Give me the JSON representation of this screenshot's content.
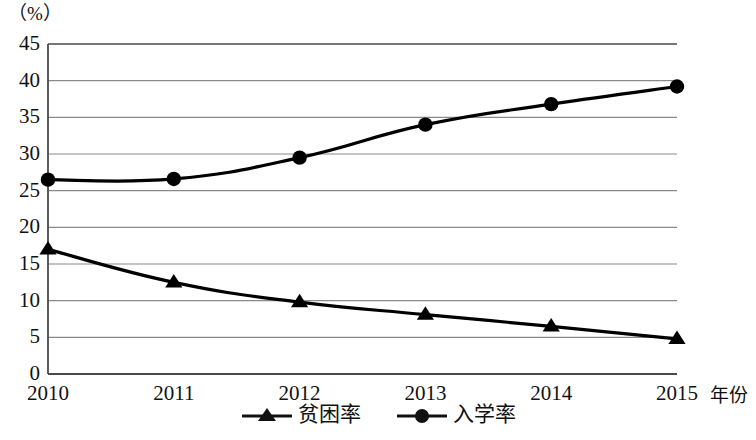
{
  "chart_data": {
    "type": "line",
    "title": "",
    "subtitle": "",
    "xlabel": "年份",
    "ylabel": "（%）",
    "unit_label": "（%）",
    "categories": [
      "2010",
      "2011",
      "2012",
      "2013",
      "2014",
      "2015"
    ],
    "x": [
      2010,
      2011,
      2012,
      2013,
      2014,
      2015
    ],
    "xlim": [
      2010,
      2015
    ],
    "ylim": [
      0,
      45
    ],
    "ytick_labels": [
      "45",
      "40",
      "35",
      "30",
      "25",
      "20",
      "15",
      "10",
      "5",
      "0"
    ],
    "yticks": [
      45,
      40,
      35,
      30,
      25,
      20,
      15,
      10,
      5,
      0
    ],
    "ytick_step": 5,
    "grid": true,
    "grid_axis": "y",
    "legend_position": "bottom",
    "series": [
      {
        "name": "贫困率",
        "marker": "triangle",
        "color": "#000000",
        "values": [
          17.0,
          12.5,
          9.8,
          8.1,
          6.5,
          4.8
        ]
      },
      {
        "name": "入学率",
        "marker": "circle",
        "color": "#000000",
        "values": [
          26.5,
          26.6,
          29.5,
          34.0,
          36.8,
          39.2
        ]
      }
    ]
  },
  "legend": {
    "items": [
      {
        "label": "贫困率",
        "marker": "triangle"
      },
      {
        "label": "入学率",
        "marker": "circle"
      }
    ]
  },
  "colors": {
    "line": "#111111",
    "grid": "#8a8a8a",
    "axis": "#4a4a4a",
    "text": "#111111",
    "background": "#ffffff"
  }
}
